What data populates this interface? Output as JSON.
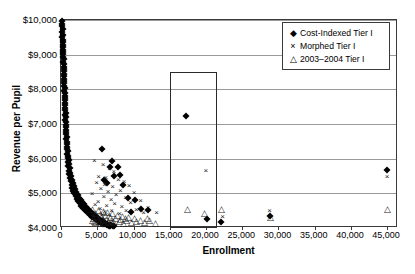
{
  "chart_data": {
    "type": "scatter",
    "title": "",
    "xlabel": "Enrollment",
    "ylabel": "Revenue per Pupil",
    "xlim": [
      0,
      46500
    ],
    "ylim": [
      4000,
      10000
    ],
    "xticks": [
      0,
      5000,
      10000,
      15000,
      20000,
      25000,
      30000,
      35000,
      40000,
      45000
    ],
    "xticklabels": [
      "0",
      "5,000",
      "10,000",
      "15,000",
      "20,000",
      "25,000",
      "30,000",
      "35,000",
      "40,000",
      "45,000"
    ],
    "yticks": [
      4000,
      5000,
      6000,
      7000,
      8000,
      9000,
      10000
    ],
    "yticklabels": [
      "$4,000",
      "$5,000",
      "$6,000",
      "$7,000",
      "$8,000",
      "$9,000",
      "$10,000"
    ],
    "grid": "horizontal",
    "legend_position": "top-right",
    "annotations": [
      {
        "name": "highlight-rectangle",
        "type": "rect",
        "x0": 15000,
        "x1": 21500,
        "y0": 4000,
        "y1": 8500
      }
    ],
    "series": [
      {
        "name": "Cost-Indexed Tier I",
        "marker": "diamond-filled",
        "color": "#000000",
        "points": [
          [
            120,
            9980
          ],
          [
            170,
            9900
          ],
          [
            150,
            9820
          ],
          [
            210,
            9740
          ],
          [
            180,
            9660
          ],
          [
            240,
            9580
          ],
          [
            200,
            9500
          ],
          [
            260,
            9430
          ],
          [
            230,
            9360
          ],
          [
            290,
            9290
          ],
          [
            250,
            9220
          ],
          [
            310,
            9150
          ],
          [
            270,
            9080
          ],
          [
            330,
            9010
          ],
          [
            300,
            8940
          ],
          [
            360,
            8870
          ],
          [
            320,
            8800
          ],
          [
            380,
            8730
          ],
          [
            340,
            8660
          ],
          [
            400,
            8590
          ],
          [
            370,
            8520
          ],
          [
            430,
            8450
          ],
          [
            390,
            8380
          ],
          [
            450,
            8310
          ],
          [
            410,
            8240
          ],
          [
            470,
            8170
          ],
          [
            440,
            8100
          ],
          [
            500,
            8030
          ],
          [
            460,
            7960
          ],
          [
            520,
            7890
          ],
          [
            490,
            7820
          ],
          [
            550,
            7750
          ],
          [
            510,
            7680
          ],
          [
            570,
            7610
          ],
          [
            540,
            7540
          ],
          [
            600,
            7470
          ],
          [
            560,
            7400
          ],
          [
            620,
            7330
          ],
          [
            590,
            7260
          ],
          [
            650,
            7190
          ],
          [
            610,
            7120
          ],
          [
            680,
            7050
          ],
          [
            640,
            6980
          ],
          [
            710,
            6910
          ],
          [
            670,
            6840
          ],
          [
            740,
            6770
          ],
          [
            700,
            6700
          ],
          [
            780,
            6630
          ],
          [
            730,
            6560
          ],
          [
            820,
            6490
          ],
          [
            770,
            6420
          ],
          [
            870,
            6350
          ],
          [
            810,
            6280
          ],
          [
            920,
            6210
          ],
          [
            860,
            6140
          ],
          [
            980,
            6080
          ],
          [
            900,
            6020
          ],
          [
            1050,
            5960
          ],
          [
            950,
            5900
          ],
          [
            1120,
            5840
          ],
          [
            1020,
            5780
          ],
          [
            1200,
            5720
          ],
          [
            1090,
            5660
          ],
          [
            1300,
            5600
          ],
          [
            1160,
            5550
          ],
          [
            1400,
            5500
          ],
          [
            1250,
            5450
          ],
          [
            1520,
            5400
          ],
          [
            1350,
            5350
          ],
          [
            1650,
            5300
          ],
          [
            1450,
            5250
          ],
          [
            1800,
            5200
          ],
          [
            1560,
            5160
          ],
          [
            1950,
            5120
          ],
          [
            1700,
            5080
          ],
          [
            2100,
            5040
          ],
          [
            1850,
            5000
          ],
          [
            2300,
            4960
          ],
          [
            2000,
            4920
          ],
          [
            2500,
            4880
          ],
          [
            2200,
            4840
          ],
          [
            2700,
            4800
          ],
          [
            2400,
            4770
          ],
          [
            2900,
            4740
          ],
          [
            2600,
            4710
          ],
          [
            3150,
            4680
          ],
          [
            2800,
            4650
          ],
          [
            3400,
            4620
          ],
          [
            3050,
            4590
          ],
          [
            3650,
            4560
          ],
          [
            3300,
            4530
          ],
          [
            3900,
            4500
          ],
          [
            3550,
            4475
          ],
          [
            4150,
            4450
          ],
          [
            3800,
            4425
          ],
          [
            4400,
            4400
          ],
          [
            4050,
            4375
          ],
          [
            4650,
            4350
          ],
          [
            4300,
            4330
          ],
          [
            4900,
            4310
          ],
          [
            4550,
            4290
          ],
          [
            5150,
            4270
          ],
          [
            4800,
            4250
          ],
          [
            5400,
            4230
          ],
          [
            5050,
            4215
          ],
          [
            5650,
            4200
          ],
          [
            5300,
            4185
          ],
          [
            5900,
            4170
          ],
          [
            5550,
            4155
          ],
          [
            6100,
            4140
          ],
          [
            5800,
            4130
          ],
          [
            6350,
            4120
          ],
          [
            6050,
            4110
          ],
          [
            6600,
            4100
          ],
          [
            6300,
            4090
          ],
          [
            6850,
            4080
          ],
          [
            6550,
            4070
          ],
          [
            7100,
            4060
          ],
          [
            6800,
            4055
          ],
          [
            7350,
            4050
          ],
          [
            5600,
            6290
          ],
          [
            7050,
            5940
          ],
          [
            6750,
            5770
          ],
          [
            7900,
            5760
          ],
          [
            8100,
            5530
          ],
          [
            7350,
            5500
          ],
          [
            5900,
            5400
          ],
          [
            8600,
            5250
          ],
          [
            6400,
            5290
          ],
          [
            9200,
            4860
          ],
          [
            10200,
            4820
          ],
          [
            11100,
            4560
          ],
          [
            12000,
            4520
          ],
          [
            9700,
            4450
          ],
          [
            17200,
            7230
          ],
          [
            20100,
            4250
          ],
          [
            22100,
            4180
          ],
          [
            28900,
            4350
          ],
          [
            45000,
            5680
          ]
        ]
      },
      {
        "name": "Morphed Tier I",
        "marker": "cross",
        "color": "#1a1a1a",
        "points": [
          [
            4600,
            5920
          ],
          [
            5800,
            5820
          ],
          [
            6700,
            5700
          ],
          [
            7300,
            5620
          ],
          [
            5200,
            5480
          ],
          [
            6200,
            5440
          ],
          [
            7900,
            5380
          ],
          [
            8700,
            5330
          ],
          [
            4900,
            5300
          ],
          [
            6000,
            5240
          ],
          [
            9400,
            5200
          ],
          [
            7100,
            5180
          ],
          [
            5500,
            5120
          ],
          [
            8200,
            5080
          ],
          [
            6500,
            5040
          ],
          [
            10100,
            5000
          ],
          [
            4300,
            4980
          ],
          [
            7600,
            4940
          ],
          [
            5900,
            4900
          ],
          [
            8900,
            4860
          ],
          [
            6900,
            4820
          ],
          [
            11000,
            4780
          ],
          [
            5100,
            4760
          ],
          [
            9600,
            4720
          ],
          [
            7400,
            4690
          ],
          [
            4700,
            4660
          ],
          [
            6300,
            4630
          ],
          [
            8400,
            4600
          ],
          [
            12000,
            4570
          ],
          [
            5400,
            4550
          ],
          [
            10400,
            4520
          ],
          [
            7000,
            4500
          ],
          [
            9000,
            4480
          ],
          [
            6000,
            4460
          ],
          [
            13200,
            4440
          ],
          [
            11400,
            4420
          ],
          [
            8100,
            4400
          ],
          [
            5700,
            4390
          ],
          [
            4400,
            4380
          ],
          [
            6600,
            4370
          ],
          [
            20000,
            5650
          ],
          [
            22300,
            4320
          ],
          [
            28800,
            4500
          ],
          [
            45000,
            5460
          ]
        ]
      },
      {
        "name": "2003–2004 Tier I",
        "marker": "triangle-open",
        "color": "#1a1a1a",
        "points": [
          [
            4400,
            4560
          ],
          [
            5100,
            4520
          ],
          [
            5800,
            4490
          ],
          [
            6400,
            4460
          ],
          [
            4700,
            4440
          ],
          [
            7100,
            4420
          ],
          [
            5400,
            4400
          ],
          [
            7800,
            4385
          ],
          [
            6100,
            4370
          ],
          [
            8500,
            4355
          ],
          [
            4900,
            4340
          ],
          [
            6800,
            4330
          ],
          [
            9300,
            4320
          ],
          [
            5600,
            4310
          ],
          [
            7500,
            4300
          ],
          [
            4500,
            4290
          ],
          [
            10100,
            4280
          ],
          [
            6300,
            4270
          ],
          [
            8200,
            4260
          ],
          [
            5200,
            4250
          ],
          [
            11000,
            4245
          ],
          [
            7000,
            4240
          ],
          [
            4300,
            4235
          ],
          [
            9000,
            4230
          ],
          [
            5900,
            4225
          ],
          [
            12200,
            4220
          ],
          [
            6600,
            4215
          ],
          [
            8000,
            4210
          ],
          [
            4600,
            4205
          ],
          [
            10400,
            4200
          ],
          [
            5300,
            4195
          ],
          [
            7300,
            4190
          ],
          [
            9700,
            4185
          ],
          [
            6000,
            4180
          ],
          [
            4800,
            4175
          ],
          [
            11500,
            4170
          ],
          [
            6900,
            4165
          ],
          [
            8600,
            4160
          ],
          [
            5500,
            4155
          ],
          [
            13100,
            4150
          ],
          [
            8900,
            4280
          ],
          [
            11900,
            4280
          ],
          [
            17400,
            4560
          ],
          [
            19800,
            4430
          ],
          [
            22200,
            4540
          ],
          [
            28900,
            4320
          ],
          [
            45000,
            4540
          ]
        ]
      }
    ]
  },
  "legend": {
    "entries": [
      {
        "mark": "diamond-filled-icon",
        "label": "Cost-Indexed Tier I"
      },
      {
        "mark": "cross-icon",
        "label": "Morphed Tier I"
      },
      {
        "mark": "triangle-open-icon",
        "label": "2003–2004 Tier I"
      }
    ]
  }
}
